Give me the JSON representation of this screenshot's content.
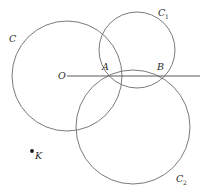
{
  "figure": {
    "type": "geometry-diagram",
    "background_color": "#ffffff",
    "stroke_color": "#6b6b6b",
    "label_color": "#2a2a2a",
    "width": 205,
    "height": 194
  },
  "labels": {
    "circle_c": "C",
    "circle_c1": "C",
    "circle_c1_sub": "1",
    "circle_c2": "C",
    "circle_c2_sub": "2",
    "center_o": "O",
    "point_a": "A",
    "point_b": "B",
    "point_k": "K"
  },
  "geometry": {
    "circles": [
      {
        "name": "C",
        "cx": 67,
        "cy": 76,
        "r": 55
      },
      {
        "name": "C1",
        "cx": 137,
        "cy": 50,
        "r": 38
      },
      {
        "name": "C2",
        "cx": 133,
        "cy": 127,
        "r": 57
      }
    ],
    "line": {
      "name": "radical-axis",
      "x1": 67,
      "y1": 76,
      "x2": 200,
      "y2": 76
    },
    "points": [
      {
        "name": "O",
        "x": 67,
        "y": 76
      },
      {
        "name": "A",
        "x": 105,
        "y": 75
      },
      {
        "name": "B",
        "x": 161,
        "y": 77
      },
      {
        "name": "K",
        "x": 32,
        "y": 151
      }
    ]
  }
}
